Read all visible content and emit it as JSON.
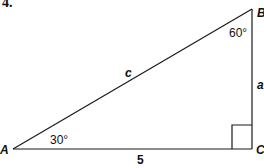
{
  "problem": {
    "number": "4."
  },
  "triangle": {
    "vertices": {
      "A": "A",
      "B": "B",
      "C": "C"
    },
    "sides": {
      "hypotenuse": "c",
      "opposite": "a",
      "adjacent": "5"
    },
    "angles": {
      "A": "30°",
      "B": "60°"
    },
    "right_angle_at": "C"
  }
}
